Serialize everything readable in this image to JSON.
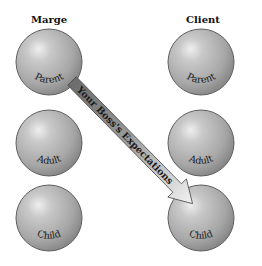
{
  "columns": [
    {
      "title": "Marge",
      "states": [
        {
          "label": "Parent"
        },
        {
          "label": "Adult"
        },
        {
          "label": "Child"
        }
      ]
    },
    {
      "title": "Client",
      "states": [
        {
          "label": "Parent"
        },
        {
          "label": "Adult"
        },
        {
          "label": "Child"
        }
      ]
    }
  ],
  "arrow": {
    "label": "Your Boss's Expectations",
    "from": "Marge Parent",
    "to": "Client Child"
  },
  "colors": {
    "sphere_light": "#e6e6e6",
    "sphere_mid": "#b4b4b4",
    "sphere_dark": "#7d7d7d",
    "sphere_edge": "#5e5e5e",
    "arrow_start": "#6b6b6b",
    "arrow_end": "#f2f2f2",
    "text": "#111111"
  }
}
